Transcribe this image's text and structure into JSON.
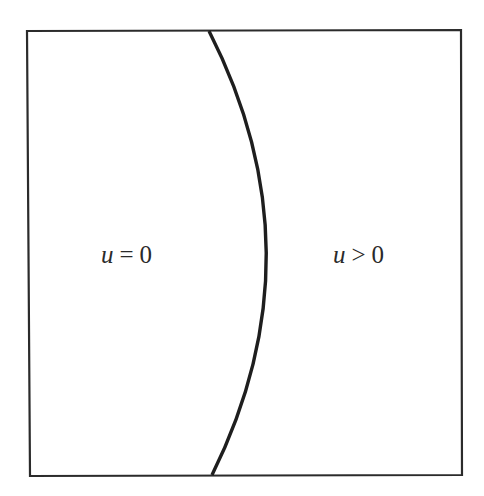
{
  "diagram": {
    "colors": {
      "background": "#ffffff",
      "border": "#2b2b2b",
      "curve": "#1e1e1e",
      "text": "#2a2a2a"
    },
    "box": {
      "top_left": [
        27,
        31
      ],
      "top_right": [
        461,
        30
      ],
      "bottom_right": [
        462,
        475
      ],
      "bottom_left": [
        30,
        476
      ]
    },
    "curve": {
      "start": [
        209,
        31
      ],
      "control": [
        322,
        253
      ],
      "end": [
        212,
        475
      ]
    },
    "regions": {
      "left": {
        "variable": "u",
        "operator": "=",
        "value": "0"
      },
      "right": {
        "variable": "u",
        "operator": ">",
        "value": "0"
      }
    }
  }
}
